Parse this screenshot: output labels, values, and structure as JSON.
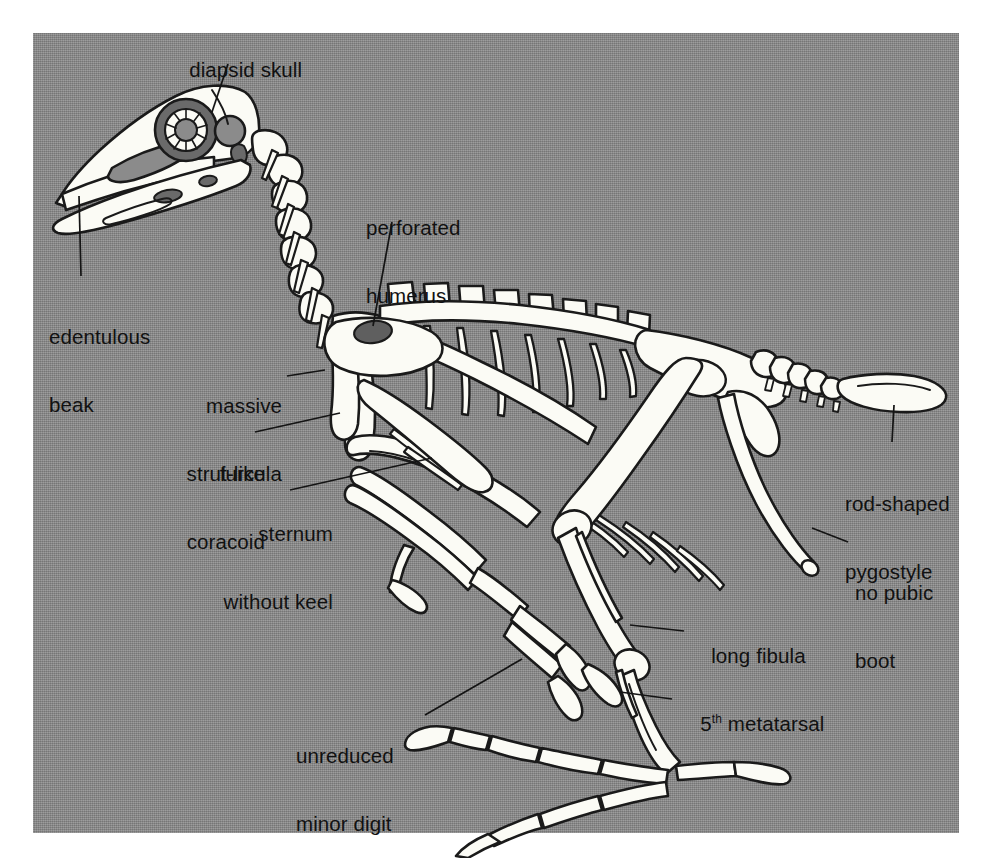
{
  "figure": {
    "plate_background_color": "#8b8b8b",
    "bone_fill_color": "#fbfbf5",
    "bone_outline_color": "#1a1a1a",
    "label_text_color": "#111111",
    "page_background_color": "#ffffff"
  },
  "labels": [
    {
      "id": "diapsid-skull",
      "text": "diapsid skull",
      "lines": [
        "diapsid skull"
      ],
      "align": "left",
      "x": 166,
      "y": 36,
      "leader": {
        "x1": 228,
        "y1": 64,
        "x2": 212,
        "y2": 112
      }
    },
    {
      "id": "edentulous-beak",
      "text": "edentulous beak",
      "lines": [
        "edentulous",
        "beak"
      ],
      "align": "left",
      "x": 49,
      "y": 281,
      "leader": {
        "x1": 81,
        "y1": 276,
        "x2": 79,
        "y2": 196
      }
    },
    {
      "id": "perforated-humerus",
      "text": "perforated humerus",
      "lines": [
        "perforated",
        "humerus"
      ],
      "align": "left",
      "x": 366,
      "y": 172,
      "leader": {
        "x1": 392,
        "y1": 222,
        "x2": 373,
        "y2": 326
      }
    },
    {
      "id": "massive-furcula",
      "text": "massive furcula",
      "lines": [
        "massive",
        "furcula"
      ],
      "align": "right",
      "x": 282,
      "y": 350,
      "leader": {
        "x1": 287,
        "y1": 376,
        "x2": 325,
        "y2": 370
      }
    },
    {
      "id": "strut-like-coracoid",
      "text": "strut-like coracoid",
      "lines": [
        "strut-like",
        "coracoid"
      ],
      "align": "right",
      "x": 265,
      "y": 418,
      "leader": {
        "x1": 255,
        "y1": 432,
        "x2": 340,
        "y2": 413
      }
    },
    {
      "id": "sternum-without-keel",
      "text": "sternum without keel",
      "lines": [
        "sternum",
        "without keel"
      ],
      "align": "right",
      "x": 333,
      "y": 478,
      "leader": {
        "x1": 290,
        "y1": 490,
        "x2": 432,
        "y2": 458
      }
    },
    {
      "id": "rod-shaped-pygostyle",
      "text": "rod-shaped pygostyle",
      "lines": [
        "rod-shaped",
        "pygostyle"
      ],
      "align": "left",
      "x": 845,
      "y": 448,
      "leader": {
        "x1": 892,
        "y1": 442,
        "x2": 894,
        "y2": 405
      }
    },
    {
      "id": "no-pubic-boot",
      "text": "no pubic boot",
      "lines": [
        "no pubic",
        "boot"
      ],
      "align": "left",
      "x": 855,
      "y": 537,
      "leader": {
        "x1": 848,
        "y1": 542,
        "x2": 812,
        "y2": 528
      }
    },
    {
      "id": "long-fibula",
      "text": "long fibula",
      "lines": [
        "long fibula"
      ],
      "align": "left",
      "x": 688,
      "y": 622,
      "leader": {
        "x1": 684,
        "y1": 631,
        "x2": 630,
        "y2": 625
      }
    },
    {
      "id": "fifth-metatarsal",
      "text": "5th metatarsal",
      "lines": [
        "5|th| metatarsal"
      ],
      "align": "left",
      "x": 677,
      "y": 690,
      "leader": {
        "x1": 672,
        "y1": 699,
        "x2": 620,
        "y2": 692
      }
    },
    {
      "id": "unreduced-minor-digit",
      "text": "unreduced minor digit",
      "lines": [
        "unreduced",
        "minor digit"
      ],
      "align": "left",
      "x": 296,
      "y": 700,
      "leader": {
        "x1": 425,
        "y1": 715,
        "x2": 522,
        "y2": 659
      }
    }
  ]
}
